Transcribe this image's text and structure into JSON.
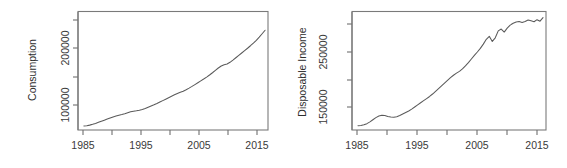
{
  "figure": {
    "background": "#ffffff",
    "line_color": "#5a5a5a",
    "axis_color": "#6f6f6f",
    "text_color": "#3a3a3a"
  },
  "chart_data": [
    {
      "type": "line",
      "title": "",
      "xlabel": "",
      "ylabel": "Consumption",
      "xlim": [
        1984.0,
        2016.5
      ],
      "ylim": [
        72000,
        252000
      ],
      "grid": false,
      "legend": "none",
      "xticks": [
        1985,
        1990,
        1995,
        2000,
        2005,
        2010,
        2015
      ],
      "xticklabels": [
        "1985",
        "",
        "1995",
        "",
        "2005",
        "",
        "2015"
      ],
      "xticklabels_shown": [
        "1985",
        "1995",
        "2005",
        "2015"
      ],
      "yticks": [
        100000,
        150000,
        200000,
        250000
      ],
      "yticklabels": [
        "100000",
        "",
        "200000",
        ""
      ],
      "yticklabels_shown": [
        "100000",
        "200000"
      ],
      "x": [
        1985.0,
        1985.5,
        1986.0,
        1986.5,
        1987.0,
        1987.5,
        1988.0,
        1988.5,
        1989.0,
        1989.5,
        1990.0,
        1990.5,
        1991.0,
        1991.5,
        1992.0,
        1992.5,
        1993.0,
        1993.5,
        1994.0,
        1994.5,
        1995.0,
        1995.5,
        1996.0,
        1996.5,
        1997.0,
        1997.5,
        1998.0,
        1998.5,
        1999.0,
        1999.5,
        2000.0,
        2000.5,
        2001.0,
        2001.5,
        2002.0,
        2002.5,
        2003.0,
        2003.5,
        2004.0,
        2004.5,
        2005.0,
        2005.5,
        2006.0,
        2006.5,
        2007.0,
        2007.5,
        2008.0,
        2008.5,
        2009.0,
        2009.5,
        2010.0,
        2010.5,
        2011.0,
        2011.5,
        2012.0,
        2012.5,
        2013.0,
        2013.5,
        2014.0,
        2014.5,
        2015.0,
        2015.5,
        2016.0
      ],
      "y": [
        78000,
        78600,
        79400,
        80600,
        82000,
        83600,
        85200,
        86900,
        88600,
        90200,
        91800,
        93200,
        94400,
        95400,
        96600,
        98200,
        99600,
        100500,
        101200,
        102000,
        103200,
        104800,
        106600,
        108400,
        110200,
        112200,
        114400,
        116600,
        118800,
        121000,
        123200,
        125400,
        127400,
        129200,
        131000,
        133200,
        135600,
        138200,
        141000,
        143800,
        146600,
        149400,
        152400,
        155600,
        159000,
        162600,
        166200,
        169200,
        171200,
        172200,
        174800,
        178200,
        181800,
        185400,
        189000,
        192600,
        196200,
        200000,
        204000,
        208200,
        213000,
        218200,
        223500
      ]
    },
    {
      "type": "line",
      "title": "",
      "xlabel": "",
      "ylabel": "Disposable Income",
      "xlim": [
        1984.0,
        2016.5
      ],
      "ylim": [
        126000,
        322000
      ],
      "grid": false,
      "legend": "none",
      "xticks": [
        1985,
        1990,
        1995,
        2000,
        2005,
        2010,
        2015
      ],
      "xticklabels": [
        "1985",
        "",
        "1995",
        "",
        "2005",
        "",
        "2015"
      ],
      "xticklabels_shown": [
        "1985",
        "1995",
        "2005",
        "2015"
      ],
      "yticks": [
        150000,
        200000,
        250000,
        300000
      ],
      "yticklabels": [
        "150000",
        "",
        "250000",
        ""
      ],
      "yticklabels_shown": [
        "150000",
        "250000"
      ],
      "x": [
        1985.0,
        1985.5,
        1986.0,
        1986.5,
        1987.0,
        1987.5,
        1988.0,
        1988.5,
        1989.0,
        1989.5,
        1990.0,
        1990.5,
        1991.0,
        1991.5,
        1992.0,
        1992.5,
        1993.0,
        1993.5,
        1994.0,
        1994.5,
        1995.0,
        1995.5,
        1996.0,
        1996.5,
        1997.0,
        1997.5,
        1998.0,
        1998.5,
        1999.0,
        1999.5,
        2000.0,
        2000.5,
        2001.0,
        2001.5,
        2002.0,
        2002.5,
        2003.0,
        2003.5,
        2004.0,
        2004.5,
        2005.0,
        2005.5,
        2006.0,
        2006.5,
        2007.0,
        2007.5,
        2008.0,
        2008.5,
        2009.0,
        2009.5,
        2010.0,
        2010.5,
        2011.0,
        2011.5,
        2012.0,
        2012.5,
        2013.0,
        2013.5,
        2014.0,
        2014.5,
        2015.0,
        2015.5,
        2016.0
      ],
      "y": [
        133000,
        133500,
        134500,
        136500,
        139500,
        143000,
        146500,
        149000,
        150500,
        150000,
        148500,
        147500,
        147000,
        148000,
        150000,
        152500,
        155000,
        157500,
        160500,
        164000,
        167500,
        171000,
        174500,
        178000,
        181500,
        185500,
        190000,
        194500,
        199000,
        203500,
        208000,
        212500,
        216500,
        220000,
        223000,
        227000,
        232000,
        237500,
        243500,
        249500,
        255000,
        261000,
        268000,
        276000,
        281000,
        272500,
        278500,
        290000,
        293000,
        288000,
        294500,
        299500,
        302500,
        304500,
        305500,
        304000,
        305500,
        308000,
        306500,
        305000,
        308500,
        306000,
        312000
      ]
    }
  ]
}
